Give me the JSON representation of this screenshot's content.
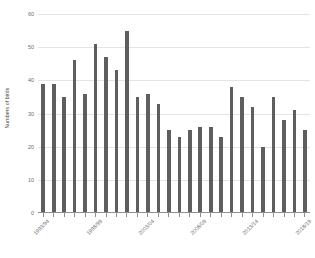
{
  "chart_data": {
    "type": "bar",
    "title": "",
    "xlabel": "",
    "ylabel": "Numbers of birds",
    "ylim": [
      0,
      60
    ],
    "grid": true,
    "legend": "none",
    "bar_color": "#5e5e5e",
    "gridline_color": "#e4e4e4",
    "axis_color": "#8f8f8f",
    "y_ticks": [
      0,
      10,
      20,
      30,
      40,
      50,
      60
    ],
    "y_tick_labels": [
      "0",
      "10",
      "20",
      "30",
      "40",
      "50",
      "60"
    ],
    "categories": [
      "1993/94",
      "1994/95",
      "1995/96",
      "1996/97",
      "1997/98",
      "1998/99",
      "1999/00",
      "2000/01",
      "2001/02",
      "2002/03",
      "2003/04",
      "2004/05",
      "2005/06",
      "2006/07",
      "2007/08",
      "2008/09",
      "2009/10",
      "2010/11",
      "2011/12",
      "2012/13",
      "2013/14",
      "2014/15",
      "2015/16",
      "2016/17",
      "2017/18",
      "2018/19"
    ],
    "values": [
      39,
      39,
      35,
      46,
      36,
      51,
      47,
      43,
      55,
      35,
      36,
      33,
      25,
      23,
      25,
      26,
      26,
      23,
      38,
      35,
      32,
      20,
      35,
      28,
      31,
      25
    ],
    "x_axis_visible_labels": [
      {
        "index": 0,
        "label": "1993/94"
      },
      {
        "index": 5,
        "label": "1998/99"
      },
      {
        "index": 10,
        "label": "2003/04"
      },
      {
        "index": 15,
        "label": "2008/09"
      },
      {
        "index": 20,
        "label": "2013/14"
      },
      {
        "index": 25,
        "label": "2018/19"
      }
    ]
  }
}
